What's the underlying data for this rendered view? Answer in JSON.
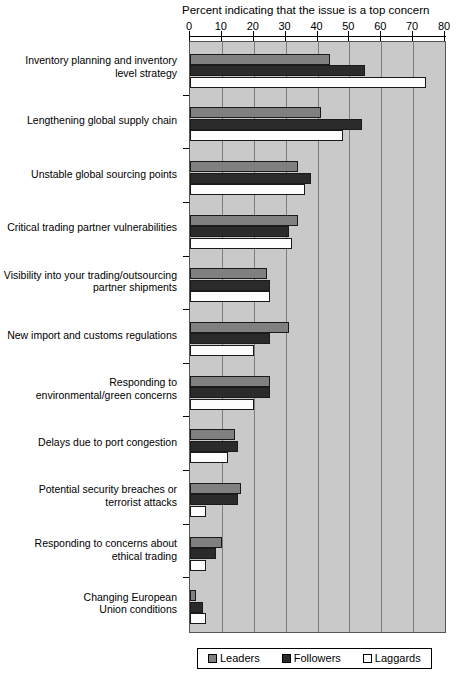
{
  "chart_data": {
    "type": "bar",
    "orientation": "horizontal",
    "title": "Percent indicating that the issue is a top concern",
    "xlabel": "",
    "ylabel": "",
    "xlim": [
      0,
      80
    ],
    "xticks": [
      0,
      10,
      20,
      30,
      40,
      50,
      60,
      70,
      80
    ],
    "grid": true,
    "legend_position": "bottom",
    "categories": [
      "Inventory planning and inventory level strategy",
      "Lengthening global supply chain",
      "Unstable global sourcing points",
      "Critical trading partner vulnerabilities",
      "Visibility into your trading/outsourcing partner shipments",
      "New import and customs regulations",
      "Responding to environmental/green concerns",
      "Delays due to port congestion",
      "Potential security breaches or terrorist attacks",
      "Responding to concerns about ethical trading",
      "Changing European Union conditions"
    ],
    "category_lines": [
      [
        "Inventory planning and inventory",
        "level strategy"
      ],
      [
        "Lengthening global supply chain"
      ],
      [
        "Unstable global sourcing points"
      ],
      [
        "Critical trading partner vulnerabilities"
      ],
      [
        "Visibility into your trading/outsourcing",
        "partner shipments"
      ],
      [
        "New import and customs regulations"
      ],
      [
        "Responding to",
        "environmental/green concerns"
      ],
      [
        "Delays due to port congestion"
      ],
      [
        "Potential security breaches or",
        "terrorist attacks"
      ],
      [
        "Responding to concerns about",
        "ethical trading"
      ],
      [
        "Changing European",
        "Union conditions"
      ]
    ],
    "series": [
      {
        "name": "Leaders",
        "color": "#808080",
        "values": [
          44,
          41,
          34,
          34,
          24,
          31,
          25,
          14,
          16,
          10,
          2
        ]
      },
      {
        "name": "Followers",
        "color": "#2b2b2b",
        "values": [
          55,
          54,
          38,
          31,
          25,
          25,
          25,
          15,
          15,
          8,
          4
        ]
      },
      {
        "name": "Laggards",
        "color": "#ffffff",
        "values": [
          74,
          48,
          36,
          32,
          25,
          20,
          20,
          12,
          5,
          5,
          5
        ]
      }
    ]
  },
  "legend": {
    "items": [
      {
        "label": "Leaders"
      },
      {
        "label": "Followers"
      },
      {
        "label": "Laggards"
      }
    ]
  }
}
